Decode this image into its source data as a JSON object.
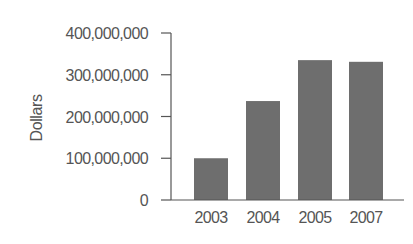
{
  "chart_data": {
    "type": "bar",
    "title": "",
    "xlabel": "",
    "ylabel": "Dollars",
    "categories": [
      "2003",
      "2004",
      "2005",
      "2007"
    ],
    "values": [
      100000000,
      237000000,
      335000000,
      331000000
    ],
    "ylim": [
      0,
      400000000
    ],
    "yticks": [
      0,
      100000000,
      200000000,
      300000000,
      400000000
    ],
    "ytick_labels": [
      "0",
      "100,000,000",
      "200,000,000",
      "300,000,000",
      "400,000,000"
    ],
    "grid": false,
    "legend": null,
    "bar_color": "#6e6e6e",
    "axis_color": "#555555"
  }
}
